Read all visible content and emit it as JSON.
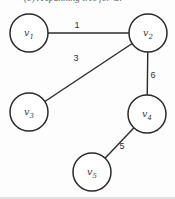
{
  "figure": {
    "caption": "(b) A spanning tree for G."
  },
  "colors": {
    "background": "#fdfdfd",
    "edge_stroke": "#2b2b2b",
    "node_stroke": "#2a2a2a",
    "node_fill": "#ffffff",
    "node_label": "#3d3d3d",
    "weight_label": "#2f2f2f",
    "caption_text": "#5a5a5a",
    "bottom_shadow": "#e3e3e3"
  },
  "graph": {
    "radius": 19,
    "nodes": [
      {
        "id": "v1",
        "label": "v",
        "sub": "1",
        "x": 29,
        "y": 33
      },
      {
        "id": "v2",
        "label": "v",
        "sub": "2",
        "x": 148,
        "y": 33
      },
      {
        "id": "v3",
        "label": "v",
        "sub": "3",
        "x": 29,
        "y": 112
      },
      {
        "id": "v4",
        "label": "v",
        "sub": "4",
        "x": 147,
        "y": 114
      },
      {
        "id": "v5",
        "label": "v",
        "sub": "5",
        "x": 92,
        "y": 172
      }
    ],
    "edges": [
      {
        "from": "v1",
        "to": "v2",
        "weight": "1",
        "lx": 77,
        "ly": 28
      },
      {
        "from": "v2",
        "to": "v3",
        "weight": "3",
        "lx": 76,
        "ly": 61
      },
      {
        "from": "v2",
        "to": "v4",
        "weight": "6",
        "lx": 153,
        "ly": 78
      },
      {
        "from": "v4",
        "to": "v5",
        "weight": "5",
        "lx": 122,
        "ly": 149
      }
    ]
  }
}
